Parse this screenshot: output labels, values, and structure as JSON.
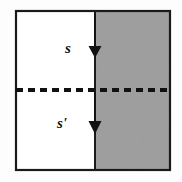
{
  "figure": {
    "canvas": {
      "width": 182,
      "height": 182,
      "background_color": "#fdfdfd"
    },
    "frame": {
      "name": "outer-rectangle",
      "x": 16,
      "y": 11,
      "width": 154,
      "height": 159,
      "stroke_color": "#1a1a1a",
      "stroke_width": 2.2
    },
    "regions": [
      {
        "name": "left-region",
        "fill_color": "#ffffff",
        "x": 16,
        "y": 11,
        "width": 79,
        "height": 159
      },
      {
        "name": "right-region",
        "fill_color": "#9c9c9c",
        "x": 95,
        "y": 11,
        "width": 75,
        "height": 159
      }
    ],
    "divider": {
      "name": "vertical-interface-line",
      "x": 95,
      "y1": 11,
      "y2": 170,
      "stroke_color": "#1a1a1a",
      "stroke_width": 2.0
    },
    "dashed_line": {
      "name": "horizontal-dashed-axis",
      "y": 90,
      "x1": 16,
      "x2": 170,
      "stroke_color": "#111111",
      "stroke_width": 4.2,
      "dash_length": 7,
      "gap_length": 5
    },
    "arrows": [
      {
        "name": "upper-arrow",
        "label": "s",
        "direction": "down",
        "x": 95,
        "shaft_start_y": 14,
        "shaft_end_y": 46,
        "head_tip_y": 58,
        "head_half_width": 6.5,
        "color": "#111111",
        "label_x": 68,
        "label_y": 53,
        "label_size": 15
      },
      {
        "name": "lower-arrow",
        "label": "s'",
        "direction": "down",
        "x": 95,
        "shaft_start_y": 92,
        "shaft_end_y": 121,
        "head_tip_y": 134,
        "head_half_width": 6.5,
        "color": "#111111",
        "label_x": 62,
        "label_y": 128,
        "label_size": 15
      }
    ]
  }
}
